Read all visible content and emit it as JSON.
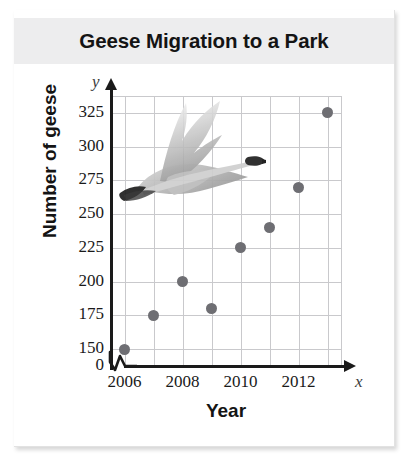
{
  "card": {
    "title": "Geese Migration to a Park"
  },
  "chart_data": {
    "type": "scatter",
    "title": "Geese Migration to a Park",
    "xlabel": "Year",
    "ylabel": "Number of geese",
    "x": [
      2006,
      2007,
      2008,
      2009,
      2010,
      2011,
      2012,
      2013
    ],
    "values": [
      150,
      175,
      200,
      180,
      225,
      240,
      270,
      325
    ],
    "xlim": [
      2005.5,
      2013.5
    ],
    "ylim": [
      137.5,
      337.5
    ],
    "y_axis_broken": true,
    "y_break_label": "0",
    "grid": true,
    "legend": "none",
    "marker_color": "#6e6e73",
    "grid_color": "#c9c9cc",
    "axis_color": "#1a1a1a",
    "title_band_color": "#ededee",
    "y_ticks": [
      "325",
      "300",
      "275",
      "250",
      "225",
      "200",
      "175",
      "150",
      "0"
    ],
    "y_tick_values": [
      325,
      300,
      275,
      250,
      225,
      200,
      175,
      150
    ],
    "x_ticks": [
      "2006",
      "2008",
      "2010",
      "2012"
    ],
    "x_tick_values": [
      2006,
      2008,
      2010,
      2012
    ],
    "x_gridline_values": [
      2006,
      2007,
      2008,
      2009,
      2010,
      2011,
      2012,
      2013
    ],
    "axis_letters": {
      "x": "x",
      "y": "y"
    },
    "annotations": [
      {
        "name": "flying-goose-illustration",
        "position": "upper-left plot area"
      }
    ]
  }
}
